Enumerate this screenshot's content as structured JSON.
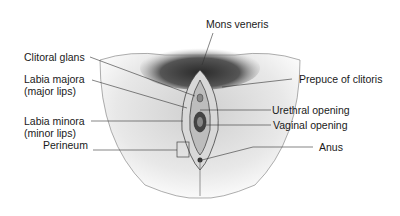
{
  "diagram": {
    "labels": {
      "mons_veneris": "Mons veneris",
      "clitoral_glans": "Clitoral glans",
      "labia_majora": "Labia majora",
      "labia_majora_alt": "(major lips)",
      "prepuce": "Prepuce of clitoris",
      "labia_minora": "Labia minora",
      "labia_minora_alt": "(minor lips)",
      "urethral_opening": "Urethral opening",
      "vaginal_opening": "Vaginal opening",
      "perineum": "Perineum",
      "anus": "Anus"
    }
  }
}
